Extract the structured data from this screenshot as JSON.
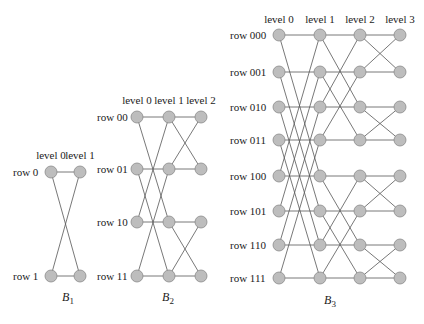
{
  "colors": {
    "node_fill": "#bdbdbd",
    "node_stroke": "#8a8a8a",
    "edge": "#555555",
    "text": "#222222"
  },
  "networks": [
    {
      "id": "B1",
      "caption": "B",
      "caption_sub": "1",
      "caption_pos": [
        68,
        301
      ],
      "levels": [
        "level 0",
        "level 1"
      ],
      "level_x": [
        51,
        80
      ],
      "level_label_y": 159,
      "rows": [
        "row 0",
        "row 1"
      ],
      "row_y": [
        172,
        276
      ],
      "row_label_x": 13,
      "dim": 1
    },
    {
      "id": "B2",
      "caption": "B",
      "caption_sub": "2",
      "caption_pos": [
        168,
        301
      ],
      "levels": [
        "level 0",
        "level 1",
        "level 2"
      ],
      "level_x": [
        137,
        169,
        201
      ],
      "level_label_y": 104,
      "rows": [
        "row 00",
        "row 01",
        "row 10",
        "row 11"
      ],
      "row_y": [
        117,
        169,
        222,
        276
      ],
      "row_label_x": 97,
      "dim": 2
    },
    {
      "id": "B3",
      "caption": "B",
      "caption_sub": "3",
      "caption_pos": [
        330,
        304
      ],
      "levels": [
        "level 0",
        "level 1",
        "level 2",
        "level 3"
      ],
      "level_x": [
        279,
        320,
        360,
        400
      ],
      "level_label_y": 23,
      "rows": [
        "row 000",
        "row 001",
        "row 010",
        "row 011",
        "row 100",
        "row 101",
        "row 110",
        "row 111"
      ],
      "row_y": [
        35,
        72,
        107,
        140,
        176,
        211,
        245,
        278
      ],
      "row_label_x": 230,
      "dim": 3
    }
  ]
}
